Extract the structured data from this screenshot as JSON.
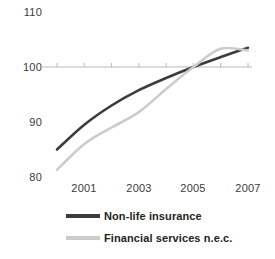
{
  "chart_data": {
    "type": "line",
    "title": "",
    "subtitle": "",
    "xlabel": "",
    "ylabel": "",
    "x": [
      2000,
      2001,
      2002,
      2003,
      2004,
      2005,
      2006,
      2007
    ],
    "xtick_labels": [
      "2001",
      "2003",
      "2005",
      "2007"
    ],
    "xtick_values": [
      2001,
      2003,
      2005,
      2007
    ],
    "xlim": [
      2000,
      2007
    ],
    "ytick_labels": [
      "110",
      "100",
      "90",
      "80"
    ],
    "ytick_values": [
      110,
      100,
      90,
      80
    ],
    "ylim": [
      78,
      111
    ],
    "grid": false,
    "axis_line_at": 100,
    "legend_position": "bottom",
    "series": [
      {
        "name": "Non-life insurance",
        "color": "#3c3c3c",
        "values": [
          85.0,
          89.5,
          93.0,
          95.8,
          98.0,
          100.0,
          101.8,
          103.5
        ]
      },
      {
        "name": "Financial services n.e.c.",
        "color": "#cccccc",
        "values": [
          81.3,
          86.0,
          89.0,
          91.8,
          96.0,
          100.0,
          103.3,
          103.0
        ]
      }
    ]
  },
  "axis": {
    "y_labels": [
      "110",
      "100",
      "90",
      "80"
    ],
    "x_labels": [
      "2001",
      "2003",
      "2005",
      "2007"
    ]
  },
  "legend": {
    "items": [
      {
        "label": "Non-life insurance",
        "color": "#3c3c3c"
      },
      {
        "label": "Financial services n.e.c.",
        "color": "#cccccc"
      }
    ]
  },
  "colors": {
    "series_dark": "#3c3c3c",
    "series_light": "#cccccc",
    "axis": "#b9b9b9",
    "text": "#3a3a3a"
  }
}
